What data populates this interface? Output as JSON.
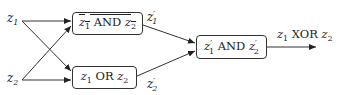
{
  "diagram": {
    "inputs": [
      {
        "id": "z1",
        "var": "z",
        "sub": "1"
      },
      {
        "id": "z2",
        "var": "z",
        "sub": "2"
      }
    ],
    "nodes": {
      "nand": {
        "a_var": "z",
        "a_sub": "1",
        "op": " AND ",
        "b_var": "z",
        "b_sub": "2",
        "negated": true
      },
      "or": {
        "a_var": "z",
        "a_sub": "1",
        "op": " OR ",
        "b_var": "z",
        "b_sub": "2"
      },
      "and": {
        "a_var": "z",
        "a_sub": "1",
        "a_prime": "′",
        "op": " AND ",
        "b_var": "z",
        "b_sub": "2",
        "b_prime": "′"
      }
    },
    "intermediates": [
      {
        "id": "z1p",
        "var": "z",
        "sub": "1",
        "prime": "′"
      },
      {
        "id": "z2p",
        "var": "z",
        "sub": "2",
        "prime": "′"
      }
    ],
    "output": {
      "a_var": "z",
      "a_sub": "1",
      "op": " XOR ",
      "b_var": "z",
      "b_sub": "2"
    },
    "edges": [
      [
        "z1",
        "nand"
      ],
      [
        "z1",
        "or"
      ],
      [
        "z2",
        "nand"
      ],
      [
        "z2",
        "or"
      ],
      [
        "nand",
        "and"
      ],
      [
        "or",
        "and"
      ],
      [
        "and",
        "output"
      ]
    ]
  }
}
